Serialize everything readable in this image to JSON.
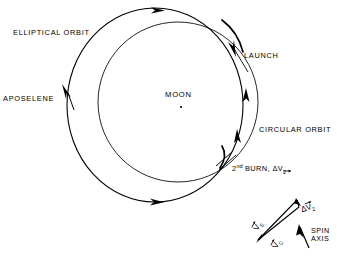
{
  "figure": {
    "background_color": "#ffffff",
    "line_color": "#000000"
  },
  "labels": {
    "elliptical_orbit": "ELLIPTICAL ORBIT",
    "aposelene": "APOSELENE",
    "launch": "LAUNCH",
    "moon": "MOON",
    "circular_orbit": "CIRCULAR ORBIT",
    "second_burn_prefix": "2",
    "second_burn_sup": "nd",
    "second_burn_text": " BURN, ΔV",
    "second_burn_sub": "2",
    "spin_axis_line1": "SPIN",
    "spin_axis_line2": "AXIS"
  },
  "vectors": {
    "v_e": "V",
    "v_e_sub": "E",
    "v_c": "V",
    "v_c_sub": "C",
    "delta_v2_delta": "Δ",
    "delta_v2": "V",
    "delta_v2_sub": "2"
  },
  "orbits": [
    {
      "name": "elliptical-orbit",
      "type": "ellipse",
      "cx": 155,
      "cy": 105,
      "rx": 88,
      "ry": 97
    },
    {
      "name": "circular-orbit",
      "type": "circle",
      "cx": 178,
      "cy": 102,
      "r": 80
    }
  ],
  "markers": {
    "moon_center": {
      "x": 181,
      "y": 107
    },
    "launch_point": {
      "x": 242,
      "y": 44
    },
    "second_burn_point": {
      "x": 228,
      "y": 160
    },
    "aposelene_point": {
      "x": 68,
      "y": 89
    }
  }
}
